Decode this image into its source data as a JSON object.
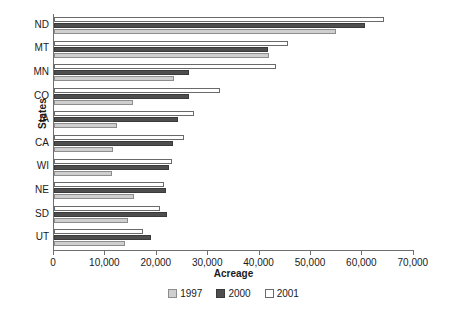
{
  "chart_data": {
    "type": "bar",
    "orientation": "horizontal",
    "title": "",
    "xlabel": "Acreage",
    "ylabel": "States",
    "xlim": [
      0,
      70000
    ],
    "xticks": [
      0,
      10000,
      20000,
      30000,
      40000,
      50000,
      60000,
      70000
    ],
    "xtick_labels": [
      "0",
      "10,000",
      "20,000",
      "30,000",
      "40,000",
      "50,000",
      "60,000",
      "70,000"
    ],
    "grid": false,
    "legend_position": "bottom",
    "categories": [
      "UT",
      "SD",
      "NE",
      "WI",
      "CA",
      "IA",
      "CO",
      "MN",
      "MT",
      "ND"
    ],
    "series": [
      {
        "name": "1997",
        "color": "#cfcfcf",
        "values": [
          13800,
          14400,
          15600,
          11300,
          11500,
          12300,
          15400,
          23300,
          41800,
          54900
        ]
      },
      {
        "name": "2000",
        "color": "#4e4e4e",
        "values": [
          18900,
          22000,
          21800,
          22400,
          23200,
          24200,
          26300,
          26300,
          41600,
          60500
        ]
      },
      {
        "name": "2001",
        "color": "#ffffff",
        "values": [
          17300,
          20600,
          21400,
          23000,
          25300,
          27300,
          32300,
          43200,
          45500,
          64200
        ]
      }
    ]
  },
  "legend": {
    "items": [
      {
        "label": "1997",
        "swatch": "swatch-1997"
      },
      {
        "label": "2000",
        "swatch": "swatch-2000"
      },
      {
        "label": "2001",
        "swatch": "swatch-2001"
      }
    ]
  }
}
